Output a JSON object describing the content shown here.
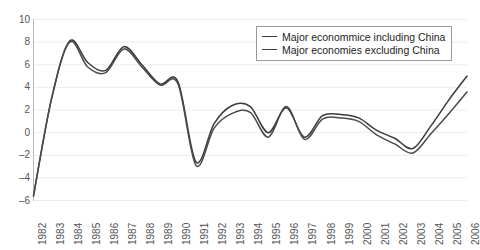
{
  "chart_data": {
    "type": "line",
    "title": "",
    "xlabel": "",
    "ylabel": "",
    "ylim": [
      -6,
      10
    ],
    "yticks": [
      10,
      8,
      6,
      4,
      2,
      0,
      -2,
      -4,
      -6
    ],
    "grid": true,
    "legend_position": "top-right",
    "x": [
      1982,
      1983,
      1984,
      1985,
      1986,
      1987,
      1988,
      1989,
      1990,
      1991,
      1992,
      1993,
      1994,
      1995,
      1996,
      1997,
      1998,
      1999,
      2000,
      2001,
      2002,
      2003,
      2004,
      2005,
      2006
    ],
    "categories": [
      "1982",
      "1983",
      "1984",
      "1985",
      "1986",
      "1987",
      "1988",
      "1989",
      "1990",
      "1991",
      "1992",
      "1993",
      "1994",
      "1995",
      "1996",
      "1997",
      "1998",
      "1999",
      "2000",
      "2001",
      "2002",
      "2003",
      "2004",
      "2005",
      "2006"
    ],
    "series": [
      {
        "name": "Major econommice including China",
        "color": "#3a3a3a",
        "values": [
          -5.6,
          3.0,
          8.1,
          6.2,
          5.5,
          7.6,
          6.0,
          4.3,
          4.5,
          -2.6,
          0.8,
          2.4,
          2.3,
          0.0,
          2.2,
          -0.4,
          1.5,
          1.6,
          1.3,
          0.2,
          -0.5,
          -1.4,
          0.6,
          2.9,
          5.0
        ]
      },
      {
        "name": "Major economies excluding China",
        "color": "#4a4a4a",
        "values": [
          -5.6,
          3.0,
          8.0,
          5.8,
          5.3,
          7.4,
          5.8,
          4.2,
          4.3,
          -2.9,
          0.4,
          1.7,
          1.8,
          -0.4,
          2.3,
          -0.6,
          1.2,
          1.3,
          1.0,
          -0.2,
          -1.0,
          -1.8,
          -0.1,
          1.7,
          3.6
        ]
      }
    ]
  },
  "legend": {
    "items": [
      {
        "label": "Major econommice including China"
      },
      {
        "label": "Major economies excluding China"
      }
    ]
  }
}
